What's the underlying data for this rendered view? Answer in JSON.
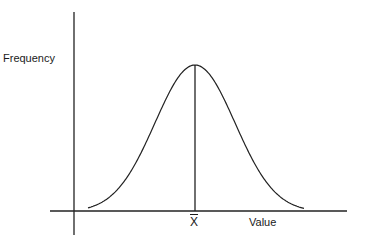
{
  "diagram": {
    "type": "normal-distribution",
    "ylabel": "Frequency",
    "xlabel": "Value",
    "mean_label": "X",
    "mean_marker": "x-bar (mean)",
    "line_color": "#222222"
  },
  "chart_data": {
    "type": "line",
    "title": "",
    "xlabel": "Value",
    "ylabel": "Frequency",
    "annotations": [
      "X̄ (mean) at peak, vertical line from peak to x-axis"
    ],
    "grid": false,
    "legend": null,
    "series": [
      {
        "name": "normal curve",
        "shape": "bell",
        "mean_position": "center",
        "symmetric": true
      }
    ]
  }
}
